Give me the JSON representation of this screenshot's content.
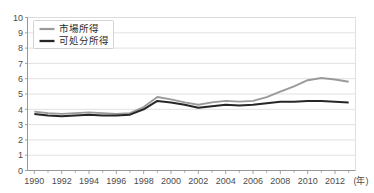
{
  "chart_data": {
    "type": "line",
    "title": "",
    "subtitle": "",
    "xlabel": "(年)",
    "ylabel": "",
    "xlim": [
      1989.5,
      2013.5
    ],
    "ylim": [
      0,
      10
    ],
    "grid": true,
    "legend_position": "top-left",
    "x": [
      1990,
      1991,
      1992,
      1993,
      1994,
      1995,
      1996,
      1997,
      1998,
      1999,
      2000,
      2001,
      2002,
      2003,
      2004,
      2005,
      2006,
      2007,
      2008,
      2009,
      2010,
      2011,
      2012,
      2013
    ],
    "xticks": [
      1990,
      1992,
      1994,
      1996,
      1998,
      2000,
      2002,
      2004,
      2006,
      2008,
      2010,
      2012
    ],
    "xticklabels": [
      "1990",
      "1992",
      "1994",
      "1996",
      "1998",
      "2000",
      "2002",
      "2004",
      "2006",
      "2008",
      "2010",
      "2012"
    ],
    "yticks": [
      0,
      1,
      2,
      3,
      4,
      5,
      6,
      7,
      8,
      9,
      10
    ],
    "yticklabels": [
      "0",
      "1",
      "2",
      "3",
      "4",
      "5",
      "6",
      "7",
      "8",
      "9",
      "10"
    ],
    "series": [
      {
        "name": "市場所得",
        "color": "#9a9a9a",
        "width": 1.9,
        "values": [
          3.85,
          3.75,
          3.7,
          3.75,
          3.8,
          3.75,
          3.7,
          3.75,
          4.15,
          4.8,
          4.65,
          4.45,
          4.3,
          4.45,
          4.55,
          4.5,
          4.55,
          4.8,
          5.15,
          5.5,
          5.9,
          6.05,
          5.95,
          5.8
        ]
      },
      {
        "name": "可処分所得",
        "color": "#262626",
        "width": 2.0,
        "values": [
          3.7,
          3.6,
          3.55,
          3.6,
          3.65,
          3.6,
          3.6,
          3.65,
          4.0,
          4.55,
          4.45,
          4.3,
          4.1,
          4.2,
          4.3,
          4.25,
          4.3,
          4.4,
          4.5,
          4.5,
          4.55,
          4.55,
          4.5,
          4.45
        ]
      }
    ]
  },
  "legend": {
    "entries": [
      {
        "label": "市場所得"
      },
      {
        "label": "可処分所得"
      }
    ]
  },
  "axis": {
    "x_unit_label": "(年)"
  }
}
